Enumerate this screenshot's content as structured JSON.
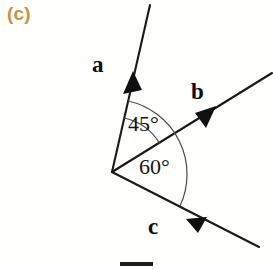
{
  "figure": {
    "panel_label": "(c)",
    "panel_label_color": "#c89048",
    "background_color": "#fffffe",
    "stroke_color": "#1a1a1a",
    "arc_color": "#3a3a3a",
    "width": 273,
    "height": 269
  },
  "vectors": [
    {
      "name": "a",
      "label": "a",
      "direction_deg": 77,
      "arrowhead": "forward",
      "description": "ray pointing up and to the right, steepest"
    },
    {
      "name": "b",
      "label": "b",
      "direction_deg": 32,
      "arrowhead": "forward",
      "description": "ray pointing up and to the right, shallow"
    },
    {
      "name": "c",
      "label": "c",
      "direction_deg": -28,
      "arrowhead": "forward",
      "description": "ray pointing down and to the right"
    }
  ],
  "angles": [
    {
      "name": "angle-a-b",
      "label": "45°",
      "value": 45,
      "unit": "degrees",
      "between": [
        "a",
        "b"
      ]
    },
    {
      "name": "angle-b-c",
      "label": "60°",
      "value": 60,
      "unit": "degrees",
      "between": [
        "b",
        "c"
      ]
    }
  ]
}
